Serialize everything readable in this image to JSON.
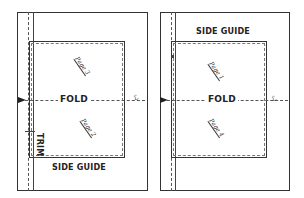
{
  "diagram": {
    "panels": [
      {
        "id": "left",
        "fold_label": "FOLD",
        "side_guide_label": "SIDE GUIDE",
        "side_guide_position": "bottom",
        "trim_label": "TRIM",
        "pages": [
          {
            "label": "Page 3",
            "position": "top"
          },
          {
            "label": "Page 2",
            "position": "bottom"
          }
        ],
        "gripper_mark": "ℰ"
      },
      {
        "id": "right",
        "fold_label": "FOLD",
        "side_guide_label": "SIDE GUIDE",
        "side_guide_position": "top",
        "pages": [
          {
            "label": "Page 1",
            "position": "top"
          },
          {
            "label": "Page 4",
            "position": "bottom"
          }
        ],
        "gripper_mark": "ℰ"
      }
    ],
    "colors": {
      "line": "#333333",
      "background": "#ffffff"
    }
  }
}
